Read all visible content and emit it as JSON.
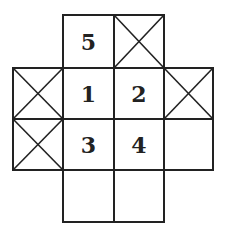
{
  "diagram": {
    "type": "grid-net",
    "stroke_color": "#222222",
    "background": "#ffffff",
    "columns_x": [
      13,
      63,
      114,
      164,
      213
    ],
    "rows_y": [
      15,
      68,
      119,
      170,
      222
    ],
    "cells": [
      {
        "row": 0,
        "col": 1,
        "kind": "number",
        "label": "5"
      },
      {
        "row": 0,
        "col": 2,
        "kind": "crossed",
        "label": ""
      },
      {
        "row": 1,
        "col": 0,
        "kind": "crossed",
        "label": ""
      },
      {
        "row": 1,
        "col": 1,
        "kind": "number",
        "label": "1"
      },
      {
        "row": 1,
        "col": 2,
        "kind": "number",
        "label": "2"
      },
      {
        "row": 1,
        "col": 3,
        "kind": "crossed",
        "label": ""
      },
      {
        "row": 2,
        "col": 0,
        "kind": "crossed",
        "label": ""
      },
      {
        "row": 2,
        "col": 1,
        "kind": "number",
        "label": "3"
      },
      {
        "row": 2,
        "col": 2,
        "kind": "number",
        "label": "4"
      },
      {
        "row": 2,
        "col": 3,
        "kind": "empty",
        "label": ""
      },
      {
        "row": 3,
        "col": 1,
        "kind": "empty",
        "label": ""
      },
      {
        "row": 3,
        "col": 2,
        "kind": "empty",
        "label": ""
      }
    ]
  }
}
